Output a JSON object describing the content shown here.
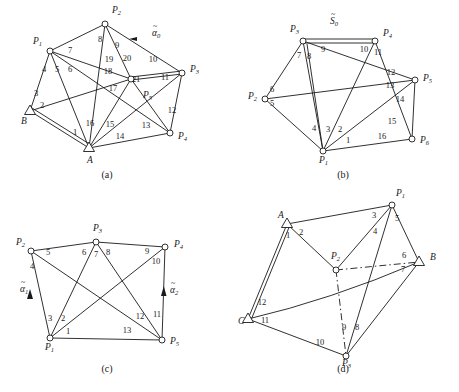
{
  "figure": {
    "background": "#ffffff",
    "stroke": "#1a1a1a",
    "width": 459,
    "height": 392,
    "panels": [
      {
        "id": "a",
        "caption": "(a)",
        "caption_pos": [
          107,
          178
        ],
        "nodes": [
          {
            "name": "P2",
            "label": "P",
            "sub": "2",
            "shape": "circle",
            "x": 105,
            "y": 24,
            "lx": 112,
            "ly": 13
          },
          {
            "name": "P1",
            "label": "P",
            "sub": "1",
            "shape": "circle",
            "x": 50,
            "y": 51,
            "lx": 33,
            "ly": 44
          },
          {
            "name": "P3",
            "label": "P",
            "sub": "3",
            "shape": "circle",
            "x": 182,
            "y": 73,
            "lx": 190,
            "ly": 72
          },
          {
            "name": "P5",
            "label": "P",
            "sub": "5",
            "shape": "circle",
            "x": 131,
            "y": 79,
            "lx": 143,
            "ly": 98
          },
          {
            "name": "P4",
            "label": "P",
            "sub": "4",
            "shape": "circle",
            "x": 170,
            "y": 133,
            "lx": 178,
            "ly": 139
          },
          {
            "name": "B",
            "label": "B",
            "sub": "",
            "shape": "triangle",
            "x": 30,
            "y": 111,
            "lx": 21,
            "ly": 124
          },
          {
            "name": "A",
            "label": "A",
            "sub": "",
            "shape": "triangle",
            "x": 89,
            "y": 148,
            "lx": 87,
            "ly": 163
          }
        ],
        "edges": [
          {
            "num": "1",
            "from": "B",
            "to": "A",
            "double": true,
            "lx": 75,
            "ly": 135
          },
          {
            "num": "2",
            "from": "B",
            "to": "P5",
            "double": false,
            "lx": 42,
            "ly": 108
          },
          {
            "num": "3",
            "from": "B",
            "to": "P1",
            "double": false,
            "lx": 36,
            "ly": 96
          },
          {
            "num": "4",
            "from": "P1",
            "to": "A",
            "double": false,
            "lx": 44,
            "ly": 72
          },
          {
            "num": "5",
            "from": "P1",
            "to": "P4",
            "double": false,
            "lx": 57,
            "ly": 72
          },
          {
            "num": "6",
            "from": "P1",
            "to": "P5",
            "double": false,
            "lx": 70,
            "ly": 72
          },
          {
            "num": "7",
            "from": "P1",
            "to": "P2",
            "double": false,
            "lx": 70,
            "ly": 53
          },
          {
            "num": "8",
            "from": "P2",
            "to": "A",
            "double": false,
            "lx": 100,
            "ly": 42
          },
          {
            "num": "9",
            "from": "P2",
            "to": "P5",
            "double": false,
            "lx": 117,
            "ly": 48
          },
          {
            "num": "10",
            "from": "P2",
            "to": "P3",
            "double": false,
            "lx": 153,
            "ly": 62
          },
          {
            "num": "11",
            "from": "P3",
            "to": "P5",
            "double": false,
            "lx": 165,
            "ly": 80
          },
          {
            "num": "12",
            "from": "P3",
            "to": "P4",
            "double": false,
            "lx": 172,
            "ly": 113
          },
          {
            "num": "13",
            "from": "P4",
            "to": "P5",
            "double": false,
            "lx": 146,
            "ly": 128
          },
          {
            "num": "14",
            "from": "P4",
            "to": "A",
            "double": false,
            "lx": 120,
            "ly": 139
          },
          {
            "num": "15",
            "from": "A",
            "to": "P5",
            "double": false,
            "lx": 110,
            "ly": 127
          },
          {
            "num": "16",
            "from": "A",
            "to": "P2",
            "double": false,
            "lx": 90,
            "ly": 126
          },
          {
            "num": "17",
            "from": "P5",
            "to": "B",
            "double": false,
            "lx": 113,
            "ly": 91
          },
          {
            "num": "18",
            "from": "P5",
            "to": "P1",
            "double": false,
            "lx": 108,
            "ly": 74
          },
          {
            "num": "19",
            "from": "P5",
            "to": "P2",
            "double": false,
            "lx": 109,
            "ly": 62
          },
          {
            "num": "20",
            "from": "P5",
            "to": "P2",
            "double": false,
            "lx": 127,
            "ly": 61
          },
          {
            "num": "21",
            "from": "P5",
            "to": "P3",
            "double": true,
            "lx": 136,
            "ly": 82
          }
        ],
        "annotations": [
          {
            "name": "alpha0",
            "text": "α",
            "tilde": true,
            "sub": "0",
            "x": 152,
            "y": 36
          }
        ]
      },
      {
        "id": "b",
        "caption": "(b)",
        "caption_pos": [
          343,
          178
        ],
        "nodes": [
          {
            "name": "P3",
            "label": "P",
            "sub": "3",
            "shape": "circle",
            "x": 303,
            "y": 41,
            "lx": 290,
            "ly": 32
          },
          {
            "name": "P4",
            "label": "P",
            "sub": "4",
            "shape": "circle",
            "x": 375,
            "y": 41,
            "lx": 383,
            "ly": 36
          },
          {
            "name": "P5",
            "label": "P",
            "sub": "5",
            "shape": "circle",
            "x": 415,
            "y": 80,
            "lx": 423,
            "ly": 81
          },
          {
            "name": "P2",
            "label": "P",
            "sub": "2",
            "shape": "circle",
            "x": 265,
            "y": 99,
            "lx": 248,
            "ly": 99
          },
          {
            "name": "P6",
            "label": "P",
            "sub": "6",
            "shape": "circle",
            "x": 412,
            "y": 139,
            "lx": 420,
            "ly": 143
          },
          {
            "name": "P1",
            "label": "P",
            "sub": "1",
            "shape": "circle",
            "x": 323,
            "y": 151,
            "lx": 319,
            "ly": 163
          }
        ],
        "edges": [
          {
            "num": "1",
            "from": "P1",
            "to": "P6",
            "double": false,
            "lx": 348,
            "ly": 143
          },
          {
            "num": "2",
            "from": "P1",
            "to": "P4",
            "double": false,
            "lx": 340,
            "ly": 132
          },
          {
            "num": "3",
            "from": "P1",
            "to": "P3",
            "double": false,
            "lx": 328,
            "ly": 132
          },
          {
            "num": "4",
            "from": "P1",
            "to": "P3",
            "double": false,
            "lx": 314,
            "ly": 131
          },
          {
            "num": "5",
            "from": "P2",
            "to": "P1",
            "double": false,
            "lx": 272,
            "ly": 106
          },
          {
            "num": "6",
            "from": "P2",
            "to": "P5",
            "double": false,
            "lx": 272,
            "ly": 92
          },
          {
            "num": "7",
            "from": "P3",
            "to": "P2",
            "double": false,
            "lx": 299,
            "ly": 58
          },
          {
            "num": "8",
            "from": "P3",
            "to": "P1",
            "double": false,
            "lx": 309,
            "ly": 59
          },
          {
            "num": "9",
            "from": "P3",
            "to": "P5",
            "double": false,
            "lx": 323,
            "ly": 52
          },
          {
            "num": "10",
            "from": "P4",
            "to": "P1",
            "double": false,
            "lx": 364,
            "ly": 52
          },
          {
            "num": "11",
            "from": "P4",
            "to": "P6",
            "double": false,
            "lx": 378,
            "ly": 55
          },
          {
            "num": "12",
            "from": "P5",
            "to": "P3",
            "double": false,
            "lx": 391,
            "ly": 75
          },
          {
            "num": "13",
            "from": "P5",
            "to": "P2",
            "double": false,
            "lx": 390,
            "ly": 88
          },
          {
            "num": "14",
            "from": "P5",
            "to": "P6",
            "double": false,
            "lx": 400,
            "ly": 102
          },
          {
            "num": "15",
            "from": "P6",
            "to": "P3",
            "double": false,
            "lx": 392,
            "ly": 124
          },
          {
            "num": "16",
            "from": "P6",
            "to": "P1",
            "double": false,
            "lx": 382,
            "ly": 139
          },
          {
            "num": "S0",
            "from": "P3",
            "to": "P4",
            "double": true,
            "lx": 0,
            "ly": 0
          }
        ],
        "annotations": [
          {
            "name": "S0",
            "text": "S",
            "tilde": true,
            "sub": "0",
            "x": 330,
            "y": 24
          }
        ]
      },
      {
        "id": "c",
        "caption": "(c)",
        "caption_pos": [
          107,
          372
        ],
        "nodes": [
          {
            "name": "P2",
            "label": "P",
            "sub": "2",
            "shape": "circle",
            "x": 31,
            "y": 251,
            "lx": 16,
            "ly": 245
          },
          {
            "name": "P3",
            "label": "P",
            "sub": "3",
            "shape": "circle",
            "x": 96,
            "y": 242,
            "lx": 93,
            "ly": 231
          },
          {
            "name": "P4",
            "label": "P",
            "sub": "4",
            "shape": "circle",
            "x": 165,
            "y": 247,
            "lx": 174,
            "ly": 247
          },
          {
            "name": "P1",
            "label": "P",
            "sub": "1",
            "shape": "circle",
            "x": 50,
            "y": 338,
            "lx": 45,
            "ly": 350
          },
          {
            "name": "P5",
            "label": "P",
            "sub": "5",
            "shape": "circle",
            "x": 162,
            "y": 340,
            "lx": 170,
            "ly": 344
          }
        ],
        "edges": [
          {
            "num": "1",
            "from": "P1",
            "to": "P5",
            "double": false,
            "lx": 68,
            "ly": 334
          },
          {
            "num": "2",
            "from": "P1",
            "to": "P3",
            "double": false,
            "lx": 63,
            "ly": 321
          },
          {
            "num": "3",
            "from": "P1",
            "to": "P4",
            "double": false,
            "lx": 50,
            "ly": 321
          },
          {
            "num": "4",
            "from": "P2",
            "to": "P1",
            "double": false,
            "lx": 32,
            "ly": 269
          },
          {
            "num": "5",
            "from": "P2",
            "to": "P5",
            "double": false,
            "lx": 48,
            "ly": 255
          },
          {
            "num": "6",
            "from": "P3",
            "to": "P1",
            "double": false,
            "lx": 84,
            "ly": 255
          },
          {
            "num": "7",
            "from": "P3",
            "to": "P5",
            "double": false,
            "lx": 96,
            "ly": 257
          },
          {
            "num": "8",
            "from": "P3",
            "to": "P5",
            "double": false,
            "lx": 108,
            "ly": 255
          },
          {
            "num": "9",
            "from": "P4",
            "to": "P1",
            "double": false,
            "lx": 147,
            "ly": 254
          },
          {
            "num": "10",
            "from": "P4",
            "to": "P3",
            "double": false,
            "lx": 156,
            "ly": 264
          },
          {
            "num": "11",
            "from": "P5",
            "to": "P4",
            "double": false,
            "lx": 157,
            "ly": 317
          },
          {
            "num": "12",
            "from": "P5",
            "to": "P3",
            "double": false,
            "lx": 140,
            "ly": 319
          },
          {
            "num": "13",
            "from": "P5",
            "to": "P1",
            "double": false,
            "lx": 127,
            "ly": 333
          }
        ],
        "annotations": [
          {
            "name": "alpha1",
            "text": "α",
            "tilde": true,
            "sub": "1",
            "x": 20,
            "y": 292
          },
          {
            "name": "alpha2",
            "text": "α",
            "tilde": true,
            "sub": "2",
            "x": 170,
            "y": 293
          }
        ]
      },
      {
        "id": "d",
        "caption": "(d)",
        "caption_pos": [
          343,
          372
        ],
        "nodes": [
          {
            "name": "P1",
            "label": "P",
            "sub": "1",
            "shape": "circle",
            "x": 392,
            "y": 205,
            "lx": 396,
            "ly": 196
          },
          {
            "name": "A",
            "label": "A",
            "sub": "",
            "shape": "triangle",
            "x": 287,
            "y": 224,
            "lx": 278,
            "ly": 218
          },
          {
            "name": "B",
            "label": "B",
            "sub": "",
            "shape": "triangle",
            "x": 419,
            "y": 262,
            "lx": 430,
            "ly": 260
          },
          {
            "name": "P2",
            "label": "P",
            "sub": "2",
            "shape": "circle",
            "x": 336,
            "y": 270,
            "lx": 331,
            "ly": 259
          },
          {
            "name": "C",
            "label": "C",
            "sub": "",
            "shape": "triangle",
            "x": 248,
            "y": 319,
            "lx": 238,
            "ly": 324
          },
          {
            "name": "P3",
            "label": "P",
            "sub": "3",
            "shape": "circle",
            "x": 346,
            "y": 356,
            "lx": 342,
            "ly": 366
          }
        ],
        "edges": [
          {
            "num": "1",
            "from": "A",
            "to": "C",
            "double": true,
            "lx": 288,
            "ly": 238
          },
          {
            "num": "2",
            "from": "A",
            "to": "P2",
            "double": false,
            "lx": 301,
            "ly": 235
          },
          {
            "num": "3",
            "from": "P1",
            "to": "A",
            "double": false,
            "lx": 374,
            "ly": 218
          },
          {
            "num": "4",
            "from": "P1",
            "to": "P2",
            "double": false,
            "lx": 375,
            "ly": 234
          },
          {
            "num": "5",
            "from": "P1",
            "to": "P3",
            "double": false,
            "lx": 397,
            "ly": 221
          },
          {
            "num": "6",
            "from": "B",
            "to": "P2",
            "double": false,
            "lx": 404,
            "ly": 258
          },
          {
            "num": "7",
            "from": "B",
            "to": "C",
            "double": false,
            "lx": 403,
            "ly": 272
          },
          {
            "num": "8",
            "from": "P3",
            "to": "B",
            "double": false,
            "lx": 357,
            "ly": 330
          },
          {
            "num": "9",
            "from": "P3",
            "to": "P2",
            "double": false,
            "lx": 344,
            "ly": 330
          },
          {
            "num": "10",
            "from": "P3",
            "to": "C",
            "double": false,
            "lx": 320,
            "ly": 345
          },
          {
            "num": "11",
            "from": "C",
            "to": "P3",
            "double": false,
            "lx": 265,
            "ly": 323
          },
          {
            "num": "12",
            "from": "C",
            "to": "A",
            "double": false,
            "lx": 262,
            "ly": 305
          }
        ],
        "annotations": []
      }
    ]
  }
}
